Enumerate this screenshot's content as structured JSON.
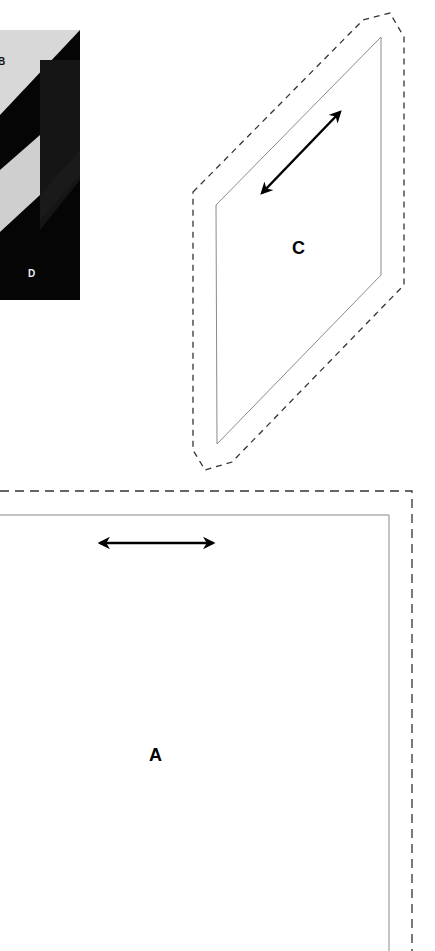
{
  "photo": {
    "labels": {
      "b": "B",
      "d": "D"
    },
    "colors": {
      "light": "#d9d9d9",
      "dark": "#0a0a0a",
      "mid": "#1c1c1c"
    }
  },
  "shape_c": {
    "label": "C",
    "outline_color": "#8a8a8a",
    "dash_color": "#333333",
    "arrow": "double-arrow-diagonal"
  },
  "shape_a": {
    "label": "A",
    "outline_color": "#8a8a8a",
    "dash_color": "#333333",
    "arrow": "double-arrow-horizontal"
  }
}
